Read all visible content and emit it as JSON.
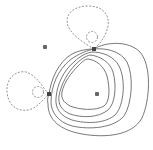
{
  "diagram": {
    "type": "orbital-contour-plot",
    "colors": {
      "positive_contour": "#555555",
      "negative_contour": "#777777",
      "atom_marker": "#666666",
      "background": "#ffffff"
    },
    "atoms": [
      {
        "id": "atom-top-left",
        "x": 45,
        "y": 47,
        "marker": "cross"
      },
      {
        "id": "atom-top-bond",
        "x": 94,
        "y": 49,
        "marker": "square"
      },
      {
        "id": "atom-left-bond",
        "x": 49,
        "y": 94,
        "marker": "square"
      },
      {
        "id": "atom-center",
        "x": 97,
        "y": 94,
        "marker": "cross"
      }
    ],
    "contours": {
      "positive_count": 5,
      "negative_lobes": [
        {
          "id": "lobe-top",
          "rings": 2,
          "style": "dashed"
        },
        {
          "id": "lobe-left",
          "rings": 2,
          "style": "dashed"
        }
      ]
    }
  }
}
